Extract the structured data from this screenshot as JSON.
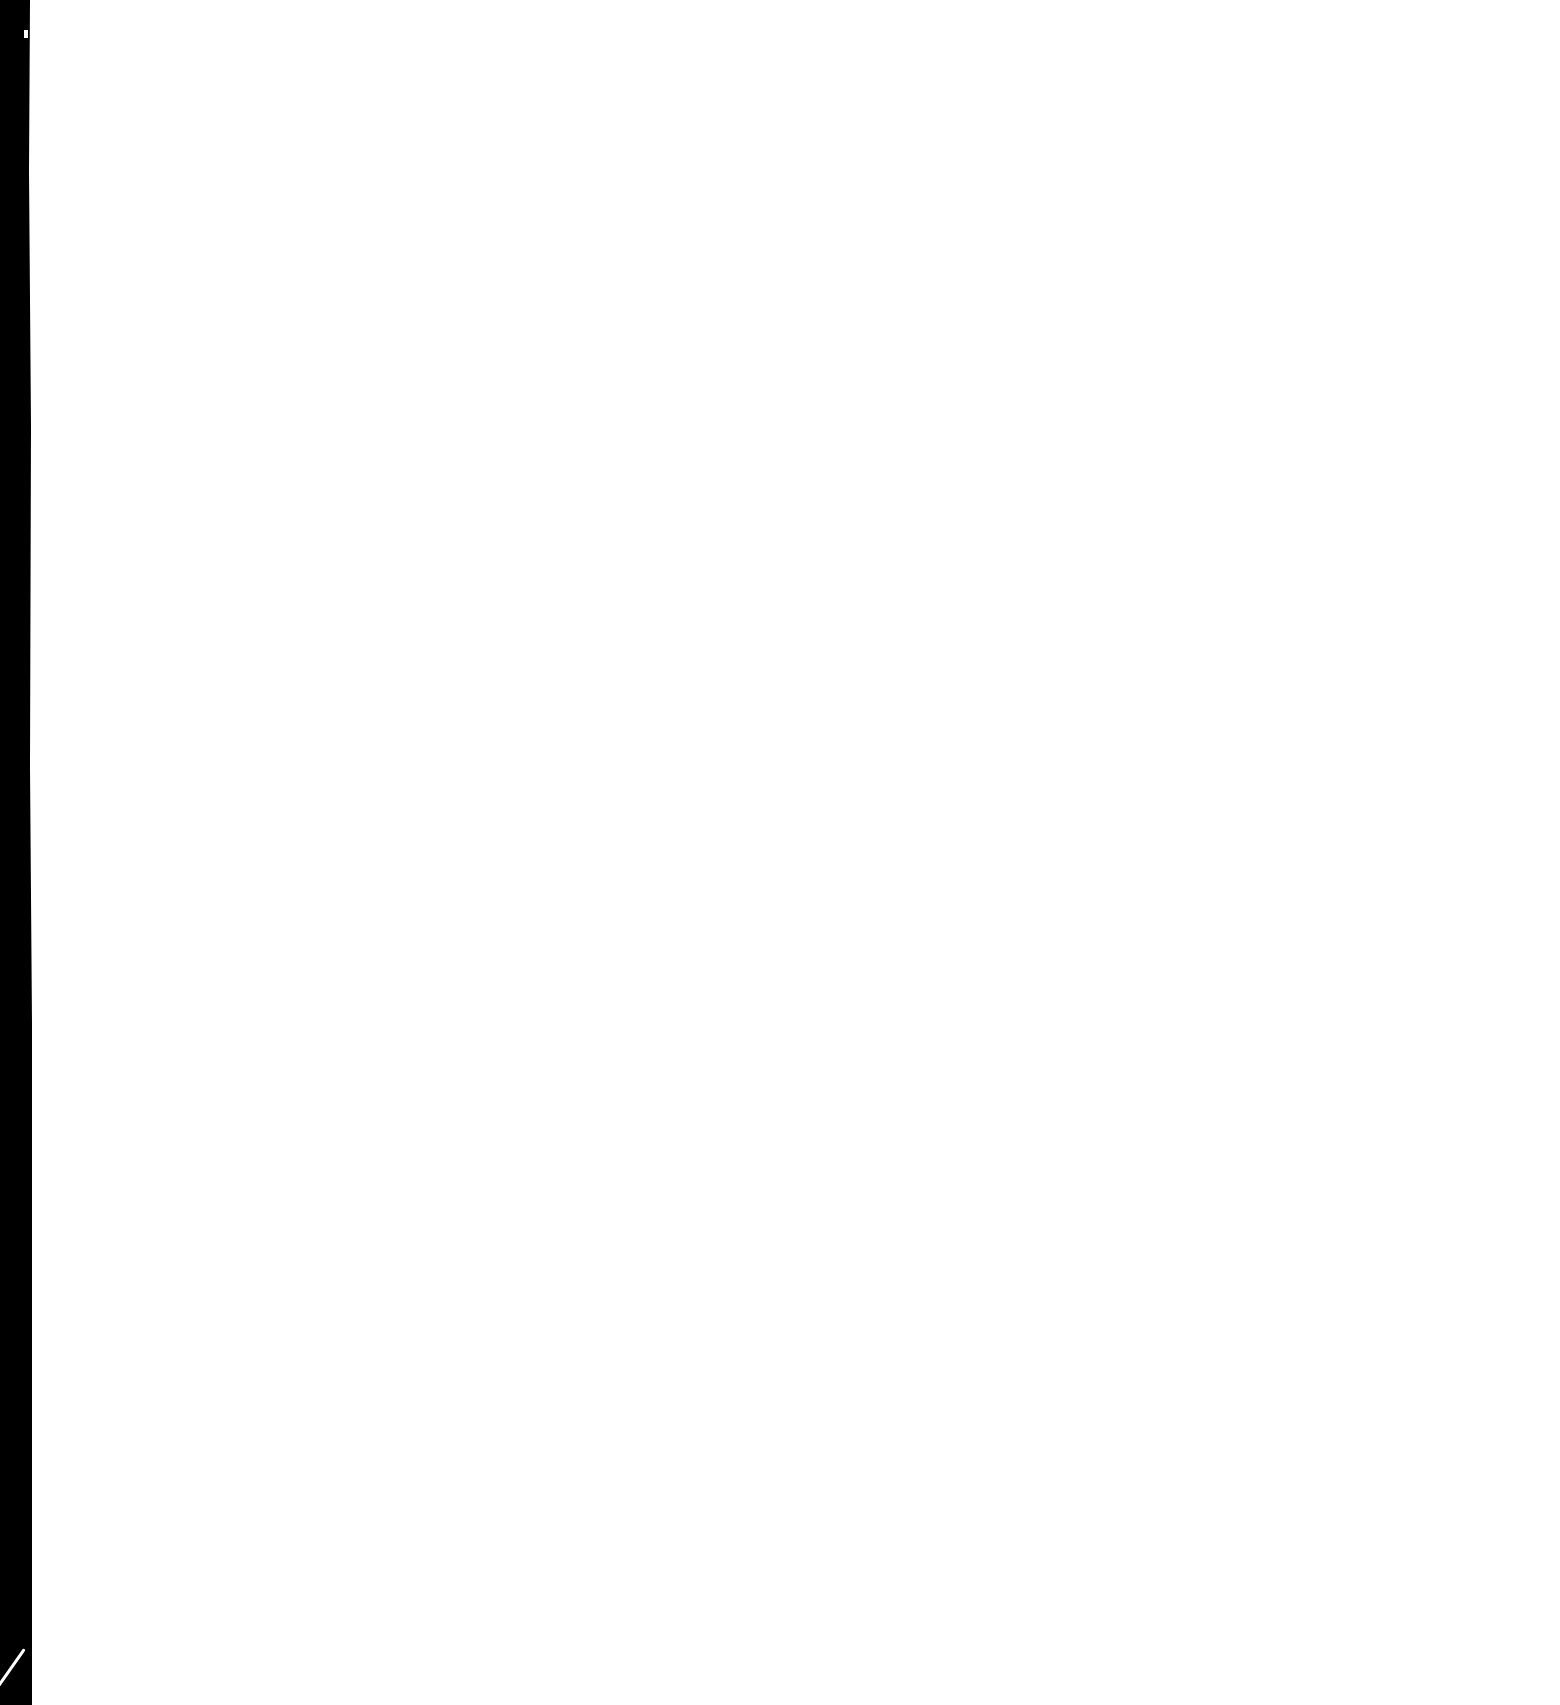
{
  "document": {
    "type": "blank scanned page",
    "text": "",
    "colors": {
      "paper": "#ffffff",
      "scan_border": "#000000"
    }
  }
}
